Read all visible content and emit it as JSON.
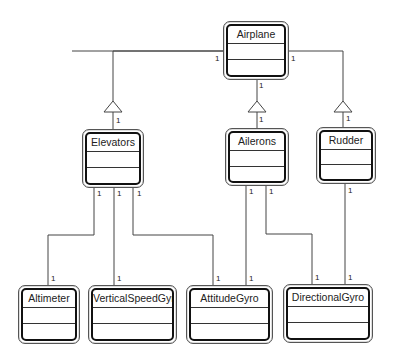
{
  "diagram": {
    "type": "UML class diagram",
    "classes": [
      {
        "id": "airplane",
        "name": "Airplane",
        "x": 223,
        "y": 21,
        "w": 66,
        "h": 59
      },
      {
        "id": "elevators",
        "name": "Elevators",
        "x": 82,
        "y": 129,
        "w": 62,
        "h": 59
      },
      {
        "id": "ailerons",
        "name": "Ailerons",
        "x": 225,
        "y": 128,
        "w": 64,
        "h": 58
      },
      {
        "id": "rudder",
        "name": "Rudder",
        "x": 316,
        "y": 127,
        "w": 60,
        "h": 57
      },
      {
        "id": "altimeter",
        "name": "Altimeter",
        "x": 18,
        "y": 285,
        "w": 62,
        "h": 59
      },
      {
        "id": "verticalspeedgyro",
        "name": "VerticalSpeedGyro",
        "x": 88,
        "y": 285,
        "w": 89,
        "h": 59
      },
      {
        "id": "attitudegyro",
        "name": "AttitudeGyro",
        "x": 186,
        "y": 285,
        "w": 87,
        "h": 59
      },
      {
        "id": "directionalgyro",
        "name": "DirectionalGyro",
        "x": 283,
        "y": 284,
        "w": 90,
        "h": 59
      }
    ],
    "relationships": [
      {
        "type": "generalization",
        "from": "Elevators",
        "to": "Airplane",
        "multiplicity_source": "1",
        "multiplicity_target": "1"
      },
      {
        "type": "generalization",
        "from": "Ailerons",
        "to": "Airplane",
        "multiplicity_source": "1",
        "multiplicity_target": "1"
      },
      {
        "type": "generalization",
        "from": "Rudder",
        "to": "Airplane",
        "multiplicity_source": "1",
        "multiplicity_target": "1"
      },
      {
        "type": "association",
        "from": "Elevators",
        "to": "Altimeter",
        "multiplicity_source": "1",
        "multiplicity_target": "1"
      },
      {
        "type": "association",
        "from": "Elevators",
        "to": "VerticalSpeedGyro",
        "multiplicity_source": "1",
        "multiplicity_target": "1"
      },
      {
        "type": "association",
        "from": "Elevators",
        "to": "AttitudeGyro",
        "multiplicity_source": "1",
        "multiplicity_target": "1"
      },
      {
        "type": "association",
        "from": "Ailerons",
        "to": "AttitudeGyro",
        "multiplicity_source": "1",
        "multiplicity_target": "1"
      },
      {
        "type": "association",
        "from": "Ailerons",
        "to": "DirectionalGyro",
        "multiplicity_source": "1",
        "multiplicity_target": "1"
      },
      {
        "type": "association",
        "from": "Rudder",
        "to": "DirectionalGyro",
        "multiplicity_source": "1",
        "multiplicity_target": "1"
      }
    ],
    "multiplicity_label": "1"
  }
}
